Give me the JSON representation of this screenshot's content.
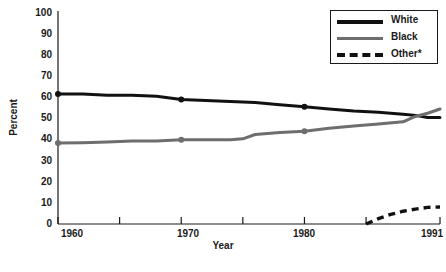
{
  "chart_data": {
    "type": "line",
    "title": "",
    "xlabel": "Year",
    "ylabel": "Percent",
    "xlim": [
      1960,
      1991
    ],
    "ylim": [
      0,
      100
    ],
    "grid": false,
    "legend_position": "top-right",
    "x_ticks": [
      1960,
      1965,
      1970,
      1975,
      1980,
      1985,
      1991
    ],
    "x_tick_labels": [
      "1960",
      "",
      "1970",
      "",
      "1980",
      "",
      "1991"
    ],
    "y_ticks": [
      0,
      10,
      20,
      30,
      40,
      50,
      60,
      70,
      80,
      90,
      100
    ],
    "y_tick_labels": [
      "0",
      "10",
      "20",
      "30",
      "40",
      "50",
      "60",
      "70",
      "80",
      "90",
      "100"
    ],
    "series": [
      {
        "name": "White",
        "color": "#111111",
        "style": "solid",
        "markers_at": [
          1960,
          1970,
          1980
        ],
        "x": [
          1960,
          1962,
          1964,
          1966,
          1968,
          1970,
          1972,
          1974,
          1976,
          1978,
          1980,
          1982,
          1984,
          1986,
          1988,
          1989,
          1990,
          1991
        ],
        "values": [
          61,
          61,
          60.5,
          60.5,
          60,
          58.5,
          58,
          57.5,
          57,
          56,
          55,
          54,
          53,
          52.5,
          51.5,
          51,
          50,
          50
        ]
      },
      {
        "name": "Black",
        "color": "#6e6e6e",
        "style": "solid",
        "markers_at": [
          1960,
          1970,
          1980
        ],
        "x": [
          1960,
          1962,
          1964,
          1966,
          1968,
          1970,
          1972,
          1974,
          1975,
          1976,
          1978,
          1980,
          1982,
          1984,
          1986,
          1988,
          1989,
          1990,
          1991
        ],
        "values": [
          38,
          38.2,
          38.5,
          39,
          39,
          39.5,
          39.5,
          39.5,
          40,
          42,
          43,
          43.5,
          45,
          46,
          47,
          48,
          50.5,
          52,
          54
        ]
      },
      {
        "name": "Other*",
        "color": "#111111",
        "style": "dashed",
        "markers_at": [],
        "x": [
          1985,
          1986,
          1987,
          1988,
          1989,
          1990,
          1991
        ],
        "values": [
          0,
          2.5,
          4.5,
          6,
          7,
          7.8,
          8
        ]
      }
    ]
  },
  "legend": {
    "entries": [
      {
        "label": "White"
      },
      {
        "label": "Black"
      },
      {
        "label": "Other*"
      }
    ]
  },
  "axes": {
    "y_title": "Percent",
    "x_title": "Year",
    "y_tick_0": "0",
    "y_tick_1": "10",
    "y_tick_2": "20",
    "y_tick_3": "30",
    "y_tick_4": "40",
    "y_tick_5": "50",
    "y_tick_6": "60",
    "y_tick_7": "70",
    "y_tick_8": "80",
    "y_tick_9": "90",
    "y_tick_10": "100",
    "x_tick_1960": "1960",
    "x_tick_1970": "1970",
    "x_tick_1980": "1980",
    "x_tick_1991": "1991"
  },
  "caption": {
    "text": ""
  }
}
